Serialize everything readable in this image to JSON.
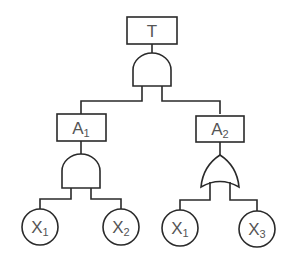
{
  "diagram": {
    "type": "fault-tree",
    "colors": {
      "stroke": "#2a2a2a",
      "text": "#555555",
      "background": "#ffffff"
    },
    "top_event": {
      "label": "T",
      "sub": ""
    },
    "top_gate": {
      "type": "AND"
    },
    "intermediate_events": [
      {
        "label": "A",
        "sub": "1",
        "gate": "AND"
      },
      {
        "label": "A",
        "sub": "2",
        "gate": "OR"
      }
    ],
    "basic_events": [
      {
        "label": "X",
        "sub": "1",
        "parent": "A1"
      },
      {
        "label": "X",
        "sub": "2",
        "parent": "A1"
      },
      {
        "label": "X",
        "sub": "1",
        "parent": "A2"
      },
      {
        "label": "X",
        "sub": "3",
        "parent": "A2"
      }
    ]
  }
}
